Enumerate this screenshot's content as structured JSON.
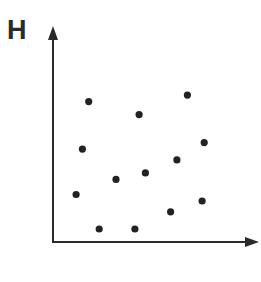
{
  "chart_data": {
    "type": "scatter",
    "title": "",
    "xlabel": "",
    "ylabel": "H",
    "grid": false,
    "legend": null,
    "axis_ticks": "none",
    "xlim": [
      0,
      100
    ],
    "ylim": [
      0,
      100
    ],
    "points": [
      {
        "x": 17,
        "y": 65
      },
      {
        "x": 64,
        "y": 68
      },
      {
        "x": 41,
        "y": 59
      },
      {
        "x": 14,
        "y": 43
      },
      {
        "x": 72,
        "y": 46
      },
      {
        "x": 59,
        "y": 38
      },
      {
        "x": 30,
        "y": 29
      },
      {
        "x": 44,
        "y": 32
      },
      {
        "x": 11,
        "y": 22
      },
      {
        "x": 71,
        "y": 19
      },
      {
        "x": 56,
        "y": 14
      },
      {
        "x": 22,
        "y": 6
      },
      {
        "x": 39,
        "y": 6
      }
    ]
  },
  "layout": {
    "origin_px": [
      53,
      242
    ],
    "x_end_px": 259,
    "y_top_px": 26,
    "dot_color": "#222222",
    "axis_color": "#2a2a2a"
  }
}
